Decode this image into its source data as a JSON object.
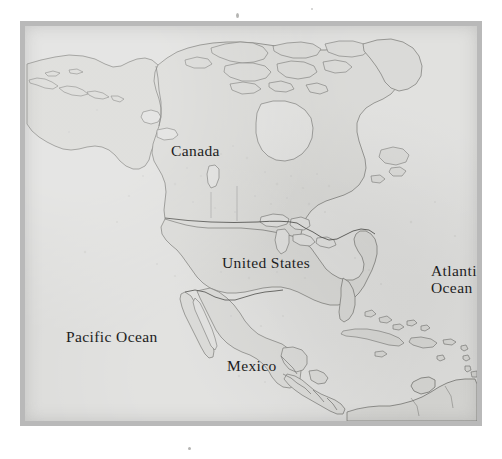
{
  "document": {
    "kind": "printed-map-plate",
    "subject": "North America"
  },
  "map": {
    "labels": {
      "canada": "Canada",
      "united_states": "United States",
      "mexico": "Mexico",
      "pacific_ocean": "Pacific Ocean",
      "atlantic_ocean_line1": "Atlantic",
      "atlantic_ocean_line2": "Ocean"
    },
    "colors": {
      "frame": "#b9b9b9",
      "ocean": "#dcdcda",
      "land": "#d4d4d1",
      "coastline": "#6f6f6c",
      "border_line": "#4a4a47",
      "label_text": "#1d1d1d",
      "page_background": "#ffffff"
    }
  },
  "geography": {
    "landmasses": [
      "Alaska",
      "Aleutian Islands",
      "Canada",
      "Canadian Arctic Archipelago",
      "Greenland (southwest tip)",
      "United States",
      "Baja California",
      "Mexico",
      "Central America",
      "Cuba",
      "Hispaniola",
      "Jamaica",
      "Puerto Rico",
      "Bahamas",
      "Lesser Antilles",
      "Northern South America"
    ],
    "water_bodies": [
      "Pacific Ocean",
      "Atlantic Ocean",
      "Gulf of Mexico",
      "Caribbean Sea",
      "Hudson Bay",
      "Great Lakes",
      "Great Slave Lake",
      "Great Bear Lake",
      "Lake Winnipeg"
    ],
    "political_borders": [
      "United States - Canada",
      "United States - Mexico",
      "Alaska - Canada",
      "Mexico - Guatemala",
      "Mexico - Belize",
      "Central American states"
    ]
  }
}
